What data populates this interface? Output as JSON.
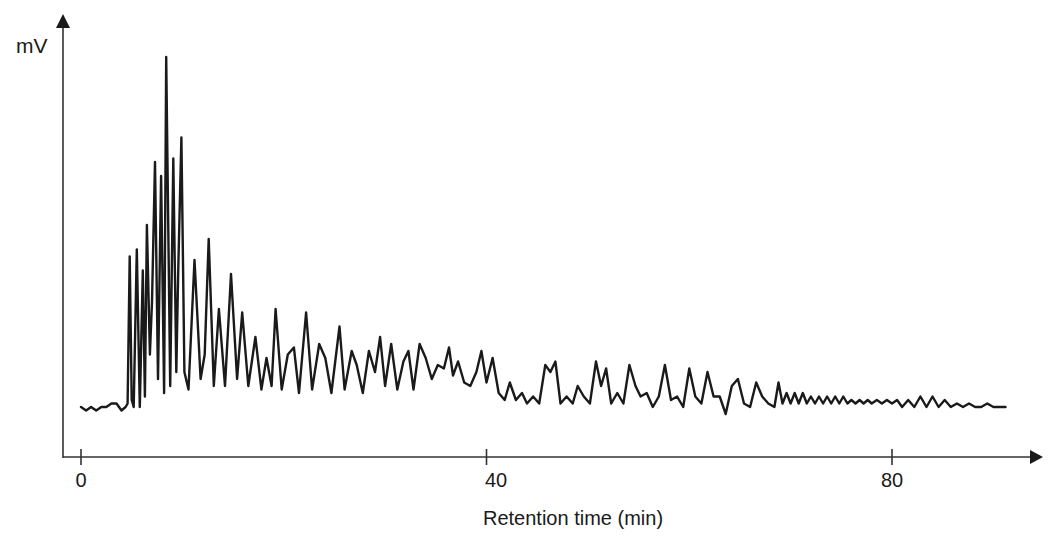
{
  "chart_data": {
    "type": "line",
    "title": "",
    "xlabel": "Retention time (min)",
    "ylabel": "mV",
    "xlim": [
      -2,
      92
    ],
    "ylim": [
      0,
      110
    ],
    "grid": false,
    "legend": null,
    "x_ticks": [
      0,
      40,
      80
    ],
    "x_tick_labels": [
      "0",
      "40",
      "80"
    ],
    "y_ticks": [],
    "line_color": "#1a1a1a",
    "axis_color": "#333333",
    "note": "Signal values are in arbitrary relative units (baseline = 0, tallest peak = 100); the y-axis has no numeric scale.",
    "series": [
      {
        "name": "chromatogram",
        "points": [
          [
            0.0,
            0
          ],
          [
            0.5,
            -1
          ],
          [
            1.0,
            0
          ],
          [
            1.5,
            -1
          ],
          [
            2.0,
            0
          ],
          [
            2.5,
            0
          ],
          [
            3.0,
            1
          ],
          [
            3.5,
            1
          ],
          [
            4.0,
            -1
          ],
          [
            4.4,
            0
          ],
          [
            4.6,
            1
          ],
          [
            4.8,
            43
          ],
          [
            5.0,
            2
          ],
          [
            5.2,
            0
          ],
          [
            5.5,
            45
          ],
          [
            5.8,
            0
          ],
          [
            6.1,
            39
          ],
          [
            6.3,
            3
          ],
          [
            6.5,
            52
          ],
          [
            6.8,
            15
          ],
          [
            7.0,
            30
          ],
          [
            7.3,
            70
          ],
          [
            7.6,
            8
          ],
          [
            7.9,
            66
          ],
          [
            8.2,
            4
          ],
          [
            8.4,
            100
          ],
          [
            8.8,
            6
          ],
          [
            9.1,
            71
          ],
          [
            9.4,
            10
          ],
          [
            9.6,
            40
          ],
          [
            9.9,
            77
          ],
          [
            10.2,
            10
          ],
          [
            10.6,
            5
          ],
          [
            11.2,
            42
          ],
          [
            11.8,
            8
          ],
          [
            12.2,
            15
          ],
          [
            12.6,
            48
          ],
          [
            13.1,
            6
          ],
          [
            13.6,
            28
          ],
          [
            14.2,
            6
          ],
          [
            14.8,
            38
          ],
          [
            15.4,
            8
          ],
          [
            15.9,
            27
          ],
          [
            16.5,
            6
          ],
          [
            17.2,
            20
          ],
          [
            17.8,
            5
          ],
          [
            18.3,
            14
          ],
          [
            18.8,
            6
          ],
          [
            19.2,
            28
          ],
          [
            19.8,
            5
          ],
          [
            20.4,
            15
          ],
          [
            21.0,
            17
          ],
          [
            21.5,
            4
          ],
          [
            22.2,
            27
          ],
          [
            22.8,
            5
          ],
          [
            23.5,
            18
          ],
          [
            24.1,
            14
          ],
          [
            24.7,
            4
          ],
          [
            25.5,
            23
          ],
          [
            26.0,
            5
          ],
          [
            26.7,
            16
          ],
          [
            27.2,
            12
          ],
          [
            27.8,
            4
          ],
          [
            28.4,
            16
          ],
          [
            29.0,
            10
          ],
          [
            29.5,
            20
          ],
          [
            30.0,
            6
          ],
          [
            30.6,
            18
          ],
          [
            31.2,
            5
          ],
          [
            31.8,
            13
          ],
          [
            32.3,
            16
          ],
          [
            32.8,
            5
          ],
          [
            33.4,
            18
          ],
          [
            34.0,
            14
          ],
          [
            34.6,
            8
          ],
          [
            35.2,
            12
          ],
          [
            35.8,
            11
          ],
          [
            36.3,
            17
          ],
          [
            36.7,
            9
          ],
          [
            37.2,
            13
          ],
          [
            37.8,
            7
          ],
          [
            38.4,
            6
          ],
          [
            39.0,
            10
          ],
          [
            39.5,
            16
          ],
          [
            40.0,
            7
          ],
          [
            40.6,
            14
          ],
          [
            41.2,
            4
          ],
          [
            41.8,
            2
          ],
          [
            42.3,
            7
          ],
          [
            42.9,
            2
          ],
          [
            43.5,
            4
          ],
          [
            44.0,
            1
          ],
          [
            44.6,
            3
          ],
          [
            45.2,
            1
          ],
          [
            45.8,
            12
          ],
          [
            46.3,
            10
          ],
          [
            46.8,
            13
          ],
          [
            47.3,
            1
          ],
          [
            47.9,
            3
          ],
          [
            48.5,
            1
          ],
          [
            49.0,
            6
          ],
          [
            49.6,
            3
          ],
          [
            50.2,
            1
          ],
          [
            50.8,
            13
          ],
          [
            51.3,
            6
          ],
          [
            51.8,
            11
          ],
          [
            52.3,
            1
          ],
          [
            52.9,
            4
          ],
          [
            53.5,
            1
          ],
          [
            54.1,
            12
          ],
          [
            54.7,
            6
          ],
          [
            55.2,
            3
          ],
          [
            55.8,
            4
          ],
          [
            56.4,
            0
          ],
          [
            57.0,
            3
          ],
          [
            57.6,
            12
          ],
          [
            58.2,
            2
          ],
          [
            58.8,
            3
          ],
          [
            59.4,
            0
          ],
          [
            60.0,
            11
          ],
          [
            60.6,
            3
          ],
          [
            61.2,
            1
          ],
          [
            61.8,
            10
          ],
          [
            62.4,
            3
          ],
          [
            63.0,
            3
          ],
          [
            63.6,
            -2
          ],
          [
            64.2,
            6
          ],
          [
            64.8,
            8
          ],
          [
            65.4,
            1
          ],
          [
            66.0,
            0
          ],
          [
            66.6,
            7
          ],
          [
            67.2,
            3
          ],
          [
            67.8,
            1
          ],
          [
            68.4,
            0
          ],
          [
            68.8,
            7
          ],
          [
            69.2,
            1
          ],
          [
            69.6,
            4
          ],
          [
            70.0,
            1
          ],
          [
            70.4,
            4
          ],
          [
            70.8,
            1
          ],
          [
            71.2,
            4
          ],
          [
            71.6,
            1
          ],
          [
            72.0,
            3
          ],
          [
            72.4,
            1
          ],
          [
            72.8,
            3
          ],
          [
            73.2,
            1
          ],
          [
            73.6,
            3
          ],
          [
            74.0,
            1
          ],
          [
            74.4,
            3
          ],
          [
            74.8,
            1
          ],
          [
            75.2,
            3
          ],
          [
            75.6,
            1
          ],
          [
            76.0,
            2
          ],
          [
            76.4,
            1
          ],
          [
            76.8,
            2
          ],
          [
            77.2,
            1
          ],
          [
            77.6,
            2
          ],
          [
            78.0,
            1
          ],
          [
            78.5,
            2
          ],
          [
            79.0,
            1
          ],
          [
            79.5,
            2
          ],
          [
            80.0,
            1
          ],
          [
            80.5,
            2
          ],
          [
            81.0,
            0
          ],
          [
            81.6,
            2
          ],
          [
            82.2,
            0
          ],
          [
            82.8,
            3
          ],
          [
            83.4,
            0
          ],
          [
            84.0,
            3
          ],
          [
            84.6,
            0
          ],
          [
            85.2,
            2
          ],
          [
            85.8,
            0
          ],
          [
            86.4,
            1
          ],
          [
            87.0,
            0
          ],
          [
            87.6,
            1
          ],
          [
            88.2,
            0
          ],
          [
            88.8,
            0
          ],
          [
            89.4,
            1
          ],
          [
            90.0,
            0
          ],
          [
            91.2,
            0
          ]
        ]
      }
    ]
  },
  "labels": {
    "ylabel": "mV",
    "xlabel": "Retention time (min)",
    "ticks": [
      "0",
      "40",
      "80"
    ]
  }
}
